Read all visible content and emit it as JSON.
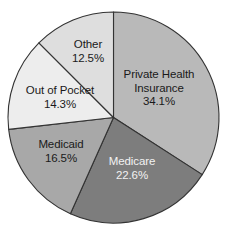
{
  "chart_data": {
    "type": "pie",
    "title": "",
    "subtitle": "",
    "xlabel": "",
    "ylabel": "",
    "legend_position": "none",
    "labels_inside": true,
    "start_angle_deg": 0,
    "direction": "clockwise",
    "categories": [
      "Private Health Insurance",
      "Medicare",
      "Medicaid",
      "Out of Pocket",
      "Other"
    ],
    "values": [
      34.1,
      22.6,
      16.5,
      14.3,
      12.5
    ],
    "value_suffix": "%",
    "slices": [
      {
        "name": "Private Health Insurance",
        "label_line1": "Private Health",
        "label_line2": "Insurance",
        "value": 34.1,
        "value_text": "34.1%",
        "color": "#b9b9b9",
        "text_color": "#1a1a1a"
      },
      {
        "name": "Medicare",
        "label_line1": "Medicare",
        "label_line2": "",
        "value": 22.6,
        "value_text": "22.6%",
        "color": "#7d7d7d",
        "text_color": "#f2f2f2"
      },
      {
        "name": "Medicaid",
        "label_line1": "Medicaid",
        "label_line2": "",
        "value": 16.5,
        "value_text": "16.5%",
        "color": "#a8a8a8",
        "text_color": "#1a1a1a"
      },
      {
        "name": "Out of Pocket",
        "label_line1": "Out of Pocket",
        "label_line2": "",
        "value": 14.3,
        "value_text": "14.3%",
        "color": "#ededed",
        "text_color": "#1a1a1a"
      },
      {
        "name": "Other",
        "label_line1": "Other",
        "label_line2": "",
        "value": 12.5,
        "value_text": "12.5%",
        "color": "#dedede",
        "text_color": "#1a1a1a"
      }
    ],
    "stroke_color": "#333333",
    "background_color": "#ffffff"
  }
}
